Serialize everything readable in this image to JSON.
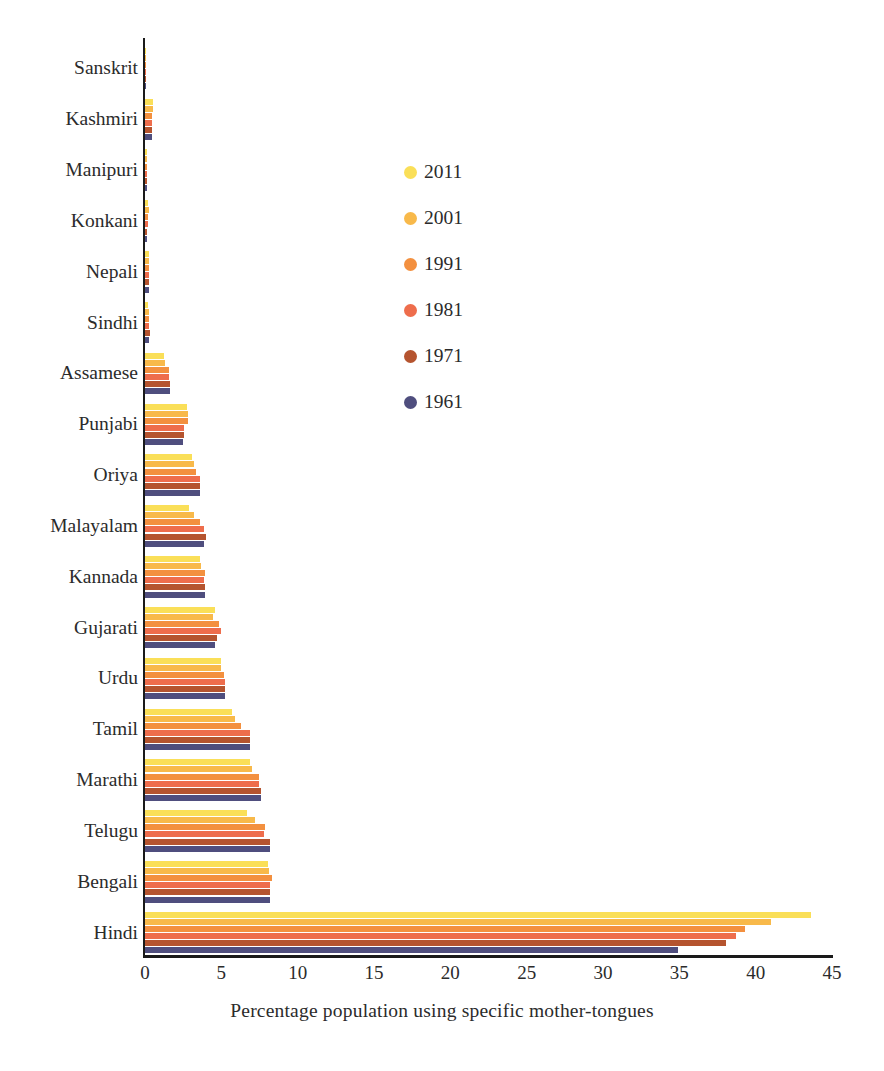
{
  "chart_data": {
    "type": "bar",
    "orientation": "horizontal",
    "title": "",
    "xlabel": "Percentage population using specific mother-tongues",
    "ylabel": "",
    "xlim": [
      0,
      45
    ],
    "xticks": [
      0,
      5,
      10,
      15,
      20,
      25,
      30,
      35,
      40,
      45
    ],
    "grid": false,
    "legend_position": "center",
    "categories": [
      "Sanskrit",
      "Kashmiri",
      "Manipuri",
      "Konkani",
      "Nepali",
      "Sindhi",
      "Assamese",
      "Punjabi",
      "Oriya",
      "Malayalam",
      "Kannada",
      "Gujarati",
      "Urdu",
      "Tamil",
      "Marathi",
      "Telugu",
      "Bengali",
      "Hindi"
    ],
    "series": [
      {
        "name": "2011",
        "color": "#fadf58",
        "values": [
          0.0,
          0.54,
          0.15,
          0.19,
          0.24,
          0.21,
          1.26,
          2.74,
          3.1,
          2.88,
          3.61,
          4.58,
          5.01,
          5.7,
          6.86,
          6.7,
          8.03,
          43.6
        ]
      },
      {
        "name": "2001",
        "color": "#f8b94a",
        "values": [
          0.0,
          0.54,
          0.14,
          0.24,
          0.28,
          0.25,
          1.28,
          2.83,
          3.21,
          3.21,
          3.69,
          4.48,
          5.01,
          5.91,
          6.99,
          7.19,
          8.11,
          41.03
        ]
      },
      {
        "name": "1991",
        "color": "#f3903f",
        "values": [
          0.01,
          0.47,
          0.15,
          0.21,
          0.25,
          0.25,
          1.55,
          2.79,
          3.35,
          3.62,
          3.91,
          4.85,
          5.18,
          6.32,
          7.45,
          7.87,
          8.3,
          39.29
        ]
      },
      {
        "name": "1981",
        "color": "#ee6d4c",
        "values": [
          0.0,
          0.47,
          0.14,
          0.19,
          0.25,
          0.25,
          1.56,
          2.56,
          3.62,
          3.86,
          3.87,
          4.98,
          5.25,
          6.88,
          7.45,
          7.8,
          8.22,
          38.74
        ]
      },
      {
        "name": "1971",
        "color": "#b5542f",
        "values": [
          0.0,
          0.46,
          0.13,
          0.16,
          0.25,
          0.3,
          1.62,
          2.57,
          3.62,
          3.99,
          3.96,
          4.72,
          5.22,
          6.88,
          7.6,
          8.16,
          8.17,
          38.05
        ]
      },
      {
        "name": "1961",
        "color": "#4f4e7e",
        "values": [
          0.0,
          0.45,
          0.13,
          0.15,
          0.26,
          0.28,
          1.63,
          2.49,
          3.62,
          3.87,
          3.96,
          4.6,
          5.22,
          6.88,
          7.62,
          8.16,
          8.17,
          34.93
        ]
      }
    ]
  },
  "legend": {
    "items": [
      {
        "label": "2011",
        "color": "#fadf58"
      },
      {
        "label": "2001",
        "color": "#f8b94a"
      },
      {
        "label": "1991",
        "color": "#f3903f"
      },
      {
        "label": "1981",
        "color": "#ee6d4c"
      },
      {
        "label": "1971",
        "color": "#b5542f"
      },
      {
        "label": "1961",
        "color": "#4f4e7e"
      }
    ]
  },
  "axis": {
    "x_title": "Percentage population using specific mother-tongues",
    "x_tick_labels": [
      "0",
      "5",
      "10",
      "15",
      "20",
      "25",
      "30",
      "35",
      "40",
      "45"
    ]
  }
}
